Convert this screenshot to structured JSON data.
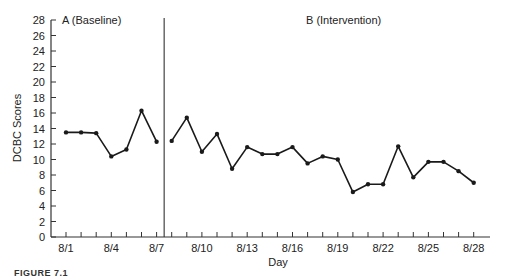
{
  "chart_data": {
    "type": "line",
    "title": "",
    "xlabel": "Day",
    "ylabel": "DCBC Scores",
    "ylim": [
      0,
      28
    ],
    "yticks": [
      0,
      2,
      4,
      6,
      8,
      10,
      12,
      14,
      16,
      18,
      20,
      22,
      24,
      26,
      28
    ],
    "xtick_labels": [
      "8/1",
      "8/4",
      "8/7",
      "8/10",
      "8/13",
      "8/16",
      "8/19",
      "8/22",
      "8/25",
      "8/28"
    ],
    "grid": false,
    "phase_line_between": [
      "8/7",
      "8/8"
    ],
    "phases": [
      {
        "name": "A (Baseline)",
        "x": [
          "8/1",
          "8/2",
          "8/3",
          "8/4",
          "8/5",
          "8/6",
          "8/7"
        ],
        "values": [
          13.5,
          13.5,
          13.4,
          10.4,
          11.3,
          16.3,
          12.3
        ]
      },
      {
        "name": "B (Intervention)",
        "x": [
          "8/8",
          "8/9",
          "8/10",
          "8/11",
          "8/12",
          "8/13",
          "8/14",
          "8/15",
          "8/16",
          "8/17",
          "8/18",
          "8/19",
          "8/20",
          "8/21",
          "8/22",
          "8/23",
          "8/24",
          "8/25",
          "8/26",
          "8/27",
          "8/28"
        ],
        "values": [
          12.4,
          15.4,
          11.0,
          13.3,
          8.8,
          11.6,
          10.7,
          10.7,
          11.6,
          9.5,
          10.4,
          10.0,
          5.8,
          6.8,
          6.8,
          11.7,
          7.7,
          9.7,
          9.7,
          8.5,
          7.0
        ]
      }
    ]
  },
  "labels": {
    "phase_a": "A (Baseline)",
    "phase_b": "B (Intervention)",
    "xlabel": "Day",
    "ylabel": "DCBC Scores",
    "caption": "FIGURE 7.1"
  },
  "colors": {
    "line": "#1a1a1a",
    "axis": "#333333"
  }
}
